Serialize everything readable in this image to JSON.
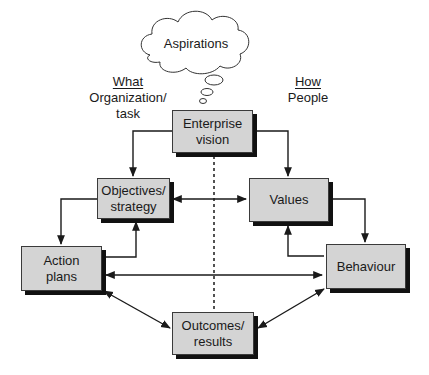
{
  "cloud": {
    "label": "Aspirations"
  },
  "left_header": {
    "title": "What",
    "subtitle_line1": "Organization/",
    "subtitle_line2": "task"
  },
  "right_header": {
    "title": "How",
    "subtitle": "People"
  },
  "boxes": {
    "enterprise_vision": {
      "line1": "Enterprise",
      "line2": "vision"
    },
    "objectives": {
      "line1": "Objectives/",
      "line2": "strategy"
    },
    "values": {
      "line1": "Values"
    },
    "action_plans": {
      "line1": "Action",
      "line2": "plans"
    },
    "behaviour": {
      "line1": "Behaviour"
    },
    "outcomes": {
      "line1": "Outcomes/",
      "line2": "results"
    }
  },
  "colors": {
    "box_fill": "#d4d4d4",
    "shadow": "#111111",
    "line": "#1a1a1a"
  }
}
